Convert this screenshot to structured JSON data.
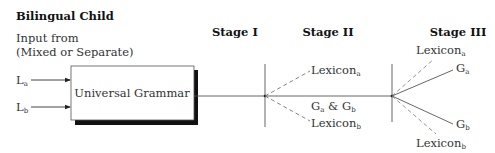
{
  "title": "Bilingual Child",
  "input": {
    "line1": "Input from",
    "line2": "(Mixed or Separate)",
    "languages": [
      {
        "base": "L",
        "sub": "a"
      },
      {
        "base": "L",
        "sub": "b"
      }
    ]
  },
  "box": {
    "label": "Universal Grammar"
  },
  "stages": [
    {
      "label": "Stage I"
    },
    {
      "label": "Stage II"
    },
    {
      "label": "Stage III"
    }
  ],
  "stage2": {
    "lexicon_a": {
      "base": "Lexicon",
      "sub": "a"
    },
    "lexicon_b": {
      "base": "Lexicon",
      "sub": "b"
    },
    "grammar": {
      "g1": "G",
      "s1": "a",
      "amp": " & ",
      "g2": "G",
      "s2": "b"
    }
  },
  "stage3": {
    "lexicon_a": {
      "base": "Lexicon",
      "sub": "a"
    },
    "grammar_a": {
      "base": "G",
      "sub": "a"
    },
    "grammar_b": {
      "base": "G",
      "sub": "b"
    },
    "lexicon_b": {
      "base": "Lexicon",
      "sub": "b"
    }
  },
  "colors": {
    "line": "#555555",
    "text": "#333333",
    "shadow": "#111111"
  }
}
